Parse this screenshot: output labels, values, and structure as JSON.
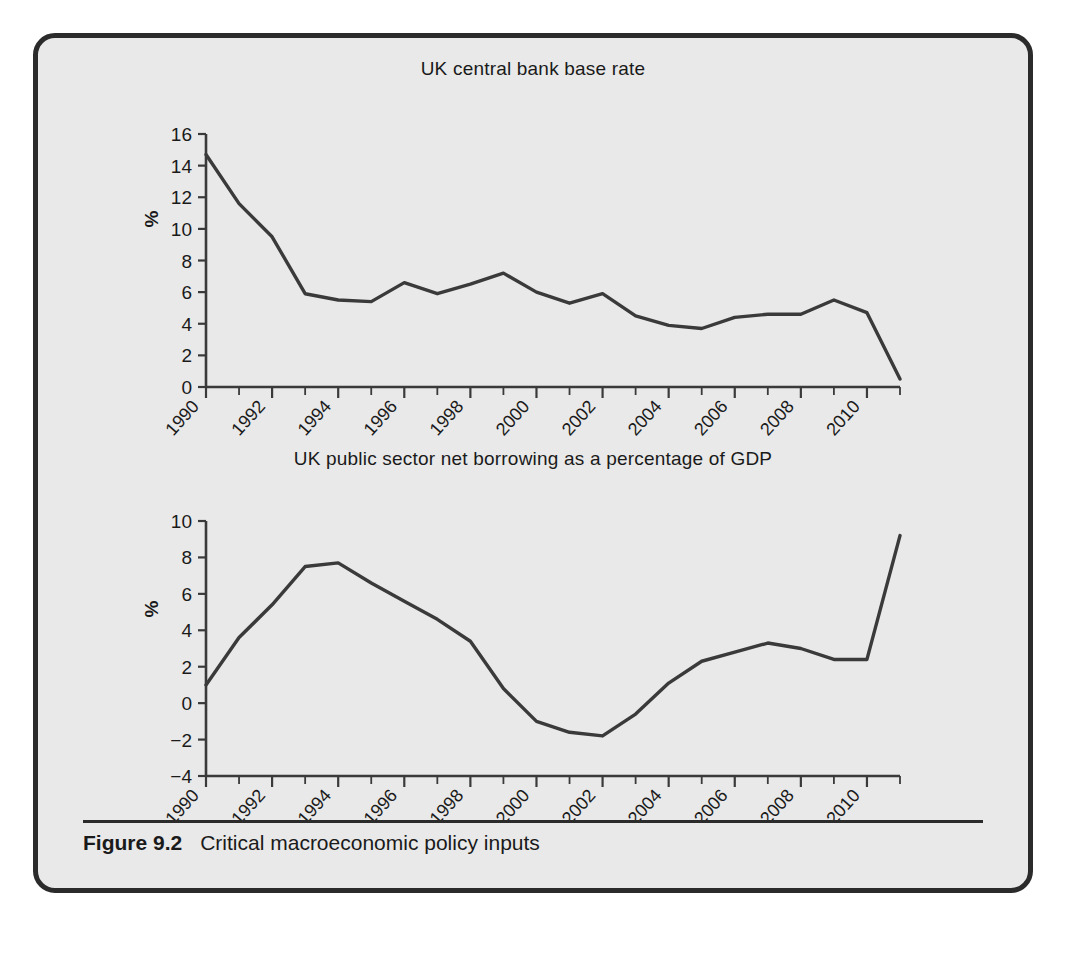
{
  "figure": {
    "caption_label": "Figure 9.2",
    "caption_text": "Critical macroeconomic policy inputs",
    "background_color": "#e9e9e9",
    "border_color": "#2b2b2b",
    "line_color": "#3a3a3a",
    "axis_color": "#3a3a3a"
  },
  "charts": [
    {
      "id": "uk-base-rate",
      "title": "UK central bank base rate",
      "ylabel": "%"
    },
    {
      "id": "uk-psnb",
      "title": "UK public sector net borrowing as a percentage of GDP",
      "ylabel": "%"
    }
  ],
  "chart_data": [
    {
      "type": "line",
      "title": "UK central bank base rate",
      "xlabel": "",
      "ylabel": "%",
      "xlim": [
        1990,
        2011
      ],
      "ylim": [
        0,
        16
      ],
      "ytick_values": [
        0,
        2,
        4,
        6,
        8,
        10,
        12,
        14,
        16
      ],
      "ytick_labels": [
        "0",
        "2",
        "4",
        "6",
        "8",
        "10",
        "12",
        "14",
        "16"
      ],
      "xtick_values": [
        1990,
        1992,
        1994,
        1996,
        1998,
        2000,
        2002,
        2004,
        2006,
        2008,
        2010
      ],
      "xtick_labels": [
        "1990",
        "1992",
        "1994",
        "1996",
        "1998",
        "2000",
        "2002",
        "2004",
        "2006",
        "2008",
        "2010"
      ],
      "minor_xticks_every": 1,
      "grid": false,
      "legend": "none",
      "x": [
        1990,
        1991,
        1992,
        1993,
        1994,
        1995,
        1996,
        1997,
        1998,
        1999,
        2000,
        2001,
        2002,
        2003,
        2004,
        2005,
        2006,
        2007,
        2008,
        2009,
        2010,
        2011
      ],
      "values": [
        14.7,
        11.6,
        9.5,
        5.9,
        5.5,
        5.4,
        6.6,
        5.9,
        6.5,
        7.2,
        6.0,
        5.3,
        5.9,
        4.5,
        3.9,
        3.7,
        4.4,
        4.6,
        4.6,
        5.5,
        4.7,
        0.5
      ],
      "series": [
        {
          "name": "UK central bank base rate",
          "values": [
            14.7,
            11.6,
            9.5,
            5.9,
            5.5,
            5.4,
            6.6,
            5.9,
            6.5,
            7.2,
            6.0,
            5.3,
            5.9,
            4.5,
            3.9,
            3.7,
            4.4,
            4.6,
            4.6,
            5.5,
            4.7,
            0.5
          ]
        }
      ]
    },
    {
      "type": "line",
      "title": "UK public sector net borrowing as a percentage of GDP",
      "xlabel": "",
      "ylabel": "%",
      "xlim": [
        1990,
        2011
      ],
      "ylim": [
        -4,
        10
      ],
      "ytick_values": [
        -4,
        -2,
        0,
        2,
        4,
        6,
        8,
        10
      ],
      "ytick_labels": [
        "−4",
        "−2",
        "0",
        "2",
        "4",
        "6",
        "8",
        "10"
      ],
      "xtick_values": [
        1990,
        1992,
        1994,
        1996,
        1998,
        2000,
        2002,
        2004,
        2006,
        2008,
        2010
      ],
      "xtick_labels": [
        "1990",
        "1992",
        "1994",
        "1996",
        "1998",
        "2000",
        "2002",
        "2004",
        "2006",
        "2008",
        "2010"
      ],
      "minor_xticks_every": 1,
      "grid": false,
      "legend": "none",
      "x": [
        1990,
        1991,
        1992,
        1993,
        1994,
        1995,
        1996,
        1997,
        1998,
        1999,
        2000,
        2001,
        2002,
        2003,
        2004,
        2005,
        2006,
        2007,
        2008,
        2009,
        2010,
        2011
      ],
      "values": [
        1.0,
        3.6,
        5.4,
        7.5,
        7.7,
        6.6,
        5.6,
        4.6,
        3.4,
        0.8,
        -1.0,
        -1.6,
        -1.8,
        -0.6,
        1.1,
        2.3,
        2.8,
        3.3,
        3.0,
        2.4,
        2.4,
        9.2
      ],
      "series": [
        {
          "name": "UK public sector net borrowing as a percentage of GDP",
          "values": [
            1.0,
            3.6,
            5.4,
            7.5,
            7.7,
            6.6,
            5.6,
            4.6,
            3.4,
            0.8,
            -1.0,
            -1.6,
            -1.8,
            -0.6,
            1.1,
            2.3,
            2.8,
            3.3,
            3.0,
            2.4,
            2.4,
            9.2
          ]
        }
      ]
    }
  ]
}
